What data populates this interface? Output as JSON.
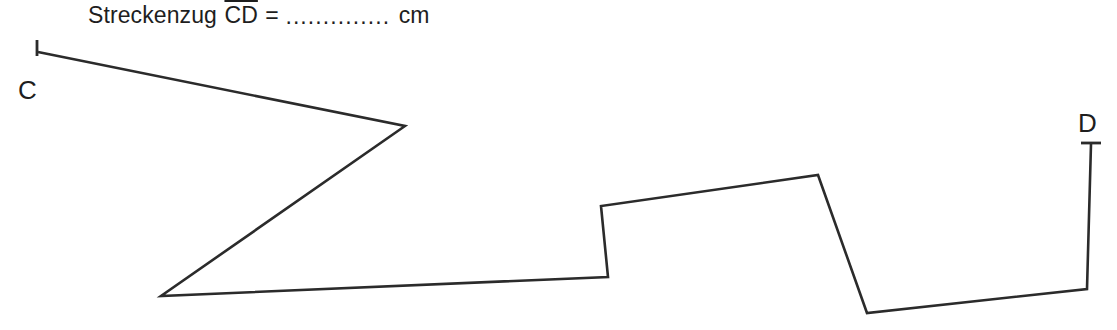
{
  "page": {
    "width": 1117,
    "height": 330,
    "background": "#ffffff",
    "ink_color": "#2b2b2b",
    "text_color": "#1e1e1e"
  },
  "caption": {
    "prefix": "Streckenzug ",
    "segment": "CD",
    "equals": " = ",
    "blank": "..............",
    "unit": " cm"
  },
  "labels": {
    "start": "C",
    "end": "D"
  },
  "figure": {
    "type": "polyline",
    "points": [
      [
        38,
        52
      ],
      [
        405,
        126
      ],
      [
        161,
        296
      ],
      [
        608,
        277
      ],
      [
        601,
        206
      ],
      [
        818,
        175
      ],
      [
        867,
        313
      ],
      [
        1087,
        289
      ],
      [
        1091,
        144
      ]
    ],
    "end_ticks": [
      {
        "name": "tick-c",
        "path": "M 37 40 L 37 56"
      },
      {
        "name": "tick-d",
        "path": "M 1081 143 L 1101 143"
      }
    ]
  }
}
